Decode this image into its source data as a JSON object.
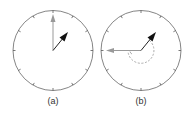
{
  "figure": {
    "panels": [
      {
        "id": "a",
        "label": "(a)",
        "center": [
          53,
          50
        ],
        "radius": 40,
        "ticks": 12,
        "reference_arrow": {
          "color": "#999999",
          "tip": [
            53,
            14
          ],
          "direction": "up"
        },
        "hand_arrow": {
          "color": "#111111",
          "tip": [
            68,
            32
          ]
        }
      },
      {
        "id": "b",
        "label": "(b)",
        "center": [
          141,
          50
        ],
        "radius": 40,
        "ticks": 12,
        "reference_arrow": {
          "color": "#999999",
          "tip": [
            106,
            50
          ],
          "direction": "left"
        },
        "hand_arrow": {
          "color": "#111111",
          "tip": [
            156,
            32
          ]
        },
        "rotation_arc": {
          "style": "dashed",
          "color": "#aaaaaa",
          "radius": 13
        }
      }
    ],
    "colors": {
      "circle": "#555555",
      "tick": "#555555",
      "reference": "#999999",
      "hand": "#111111",
      "arc": "#aaaaaa"
    }
  }
}
